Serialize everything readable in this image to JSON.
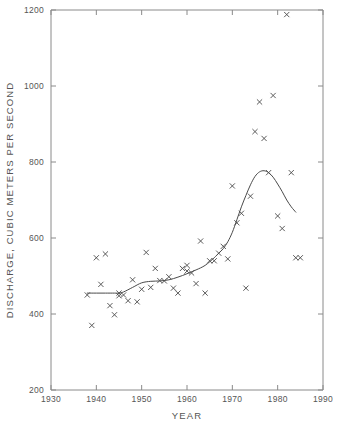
{
  "chart_data": {
    "type": "scatter",
    "title": "",
    "xlabel": "YEAR",
    "ylabel": "DISCHARGE, CUBIC METERS PER SECOND",
    "xlim": [
      1930,
      1990
    ],
    "ylim": [
      200,
      1200
    ],
    "xticks": [
      1930,
      1940,
      1950,
      1960,
      1970,
      1980,
      1990
    ],
    "yticks": [
      200,
      400,
      600,
      800,
      1000,
      1200
    ],
    "xtick_labels": [
      "1930",
      "1940",
      "1950",
      "1960",
      "1970",
      "1980",
      "1990"
    ],
    "ytick_labels": [
      "200",
      "400",
      "600",
      "800",
      "1000",
      "1200"
    ],
    "grid": false,
    "legend": false,
    "marker_style": "x",
    "marker_color": "#4a4a4a",
    "line_color": "#4a4a4a",
    "axis_color": "#8a8a8a",
    "series": [
      {
        "name": "Annual discharge observations",
        "type": "scatter",
        "x": [
          1938,
          1939,
          1940,
          1941,
          1942,
          1943,
          1944,
          1945,
          1945,
          1946,
          1947,
          1948,
          1949,
          1950,
          1951,
          1952,
          1953,
          1954,
          1955,
          1956,
          1957,
          1958,
          1959,
          1960,
          1960,
          1961,
          1962,
          1963,
          1964,
          1965,
          1966,
          1967,
          1968,
          1969,
          1970,
          1971,
          1972,
          1973,
          1974,
          1975,
          1976,
          1977,
          1978,
          1979,
          1980,
          1981,
          1982,
          1983,
          1984,
          1985
        ],
        "y": [
          450,
          370,
          548,
          478,
          558,
          422,
          398,
          455,
          448,
          450,
          435,
          490,
          432,
          465,
          562,
          470,
          520,
          488,
          487,
          498,
          468,
          455,
          520,
          528,
          513,
          508,
          480,
          592,
          455,
          540,
          540,
          560,
          578,
          545,
          737,
          640,
          665,
          468,
          710,
          880,
          958,
          862,
          772,
          975,
          658,
          625,
          1188,
          772,
          548,
          548
        ]
      },
      {
        "name": "Smoothed trend",
        "type": "line",
        "x": [
          1938,
          1940,
          1942,
          1944,
          1945,
          1946,
          1948,
          1950,
          1952,
          1954,
          1956,
          1958,
          1960,
          1962,
          1964,
          1966,
          1967,
          1968,
          1969,
          1970,
          1971,
          1972,
          1973,
          1974,
          1975,
          1976,
          1977,
          1978,
          1979,
          1980,
          1981,
          1982,
          1983,
          1984
        ],
        "y": [
          455,
          455,
          455,
          455,
          455,
          458,
          470,
          482,
          486,
          487,
          490,
          497,
          506,
          516,
          528,
          548,
          560,
          572,
          590,
          615,
          648,
          682,
          712,
          740,
          762,
          774,
          777,
          772,
          760,
          742,
          722,
          700,
          682,
          668
        ]
      }
    ]
  },
  "axes": {
    "x_label": "YEAR",
    "y_label": "DISCHARGE, CUBIC METERS PER SECOND"
  }
}
